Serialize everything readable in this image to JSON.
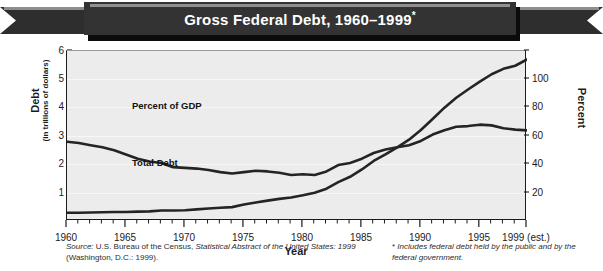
{
  "banner": {
    "title": "Gross Federal Debt, 1960–1999",
    "title_marker": "*"
  },
  "axis": {
    "left_title_main": "Debt",
    "left_title_sub": "(in trillions of dollars)",
    "right_title": "Percent",
    "x_title": "Year",
    "left_ticks": [
      "6",
      "5",
      "4",
      "3",
      "2",
      "1"
    ],
    "right_ticks": [
      "100",
      "80",
      "60",
      "40",
      "20"
    ],
    "x_ticks": [
      "1960",
      "1965",
      "1970",
      "1975",
      "1980",
      "1985",
      "1990",
      "1995",
      "1999 (est.)"
    ]
  },
  "labels": {
    "series_gdp": "Percent of GDP",
    "series_debt": "Total Debt"
  },
  "notes": {
    "source_prefix": "Source:",
    "source_text": " U.S. Bureau of the Census, ",
    "source_italic": "Statistical Abstract of the United States: 1999",
    "source_suffix": " (Washington, D.C.: 1999).",
    "footnote_star": "*",
    "footnote_text": " Includes federal debt held by the public and by the federal government."
  },
  "colors": {
    "banner_dark": "#333333",
    "banner_tail": "#2e2e2e",
    "plot_bg": "#ececed",
    "line": "#242424",
    "text": "#1b1b1b"
  },
  "chart_data": {
    "type": "line",
    "title": "Gross Federal Debt, 1960–1999*",
    "xlabel": "Year",
    "ylabel": "Debt (in trillions of dollars)",
    "y2label": "Percent",
    "xlim": [
      1960,
      1999
    ],
    "ylim": [
      0,
      6
    ],
    "y2lim": [
      0,
      120
    ],
    "grid": true,
    "legend": "inline-labels",
    "x": [
      1960,
      1961,
      1962,
      1963,
      1964,
      1965,
      1966,
      1967,
      1968,
      1969,
      1970,
      1971,
      1972,
      1973,
      1974,
      1975,
      1976,
      1977,
      1978,
      1979,
      1980,
      1981,
      1982,
      1983,
      1984,
      1985,
      1986,
      1987,
      1988,
      1989,
      1990,
      1991,
      1992,
      1993,
      1994,
      1995,
      1996,
      1997,
      1998,
      1999
    ],
    "series": [
      {
        "name": "Total Debt",
        "unit": "trillions of dollars",
        "axis": "left",
        "values": [
          0.29,
          0.29,
          0.3,
          0.31,
          0.32,
          0.32,
          0.33,
          0.34,
          0.37,
          0.37,
          0.38,
          0.41,
          0.44,
          0.47,
          0.49,
          0.58,
          0.65,
          0.72,
          0.78,
          0.83,
          0.91,
          1.0,
          1.14,
          1.37,
          1.56,
          1.82,
          2.12,
          2.35,
          2.6,
          2.87,
          3.21,
          3.6,
          4.0,
          4.35,
          4.64,
          4.92,
          5.18,
          5.37,
          5.48,
          5.7
        ]
      },
      {
        "name": "Percent of GDP",
        "unit": "percent",
        "axis": "right",
        "values": [
          56.0,
          55.0,
          53.5,
          52.0,
          50.0,
          47.0,
          44.0,
          42.0,
          41.0,
          38.0,
          37.5,
          37.0,
          36.0,
          34.5,
          33.5,
          34.5,
          35.5,
          35.0,
          34.0,
          32.5,
          33.0,
          32.5,
          35.0,
          39.5,
          41.0,
          44.0,
          48.0,
          50.5,
          52.0,
          53.5,
          56.5,
          61.0,
          64.0,
          66.5,
          67.0,
          68.0,
          67.5,
          65.5,
          64.5,
          64.0
        ]
      }
    ],
    "annotations": [
      {
        "text": "Percent of GDP",
        "near_year": 1969
      },
      {
        "text": "Total Debt",
        "near_year": 1969
      }
    ],
    "source": "U.S. Bureau of the Census, Statistical Abstract of the United States: 1999 (Washington, D.C.: 1999).",
    "footnote": "* Includes federal debt held by the public and by the federal government."
  }
}
